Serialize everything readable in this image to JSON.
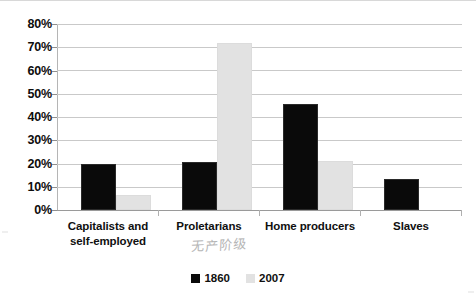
{
  "chart_data": {
    "type": "bar",
    "title": "",
    "subtitle": "",
    "xlabel": "",
    "ylabel": "",
    "categories": [
      "Capitalists and self-employed",
      "Proletarians",
      "Home producers",
      "Slaves"
    ],
    "category_lines": [
      [
        "Capitalists and",
        "self-employed"
      ],
      [
        "Proletarians"
      ],
      [
        "Home producers"
      ],
      [
        "Slaves"
      ]
    ],
    "series": [
      {
        "name": "1860",
        "color": "#0a0a0a",
        "values": [
          20,
          20.5,
          45.5,
          13.5
        ]
      },
      {
        "name": "2007",
        "color": "#e2e2e2",
        "values": [
          6.5,
          72,
          21,
          0
        ]
      }
    ],
    "ylim": [
      0,
      80
    ],
    "ytick_step": 10,
    "ytick_labels": [
      "80%",
      "70%",
      "60%",
      "50%",
      "40%",
      "30%",
      "20%",
      "10%",
      "0%"
    ],
    "ytick_values": [
      80,
      70,
      60,
      50,
      40,
      30,
      20,
      10,
      0
    ],
    "grid": true,
    "legend_position": "bottom-center",
    "value_format": "percent"
  },
  "legend": {
    "entries": [
      {
        "label": "1860",
        "swatch": "black-square-swatch"
      },
      {
        "label": "2007",
        "swatch": "light-gray-square-swatch"
      }
    ]
  },
  "annotations": {
    "handwritten_note": "无产阶级"
  }
}
